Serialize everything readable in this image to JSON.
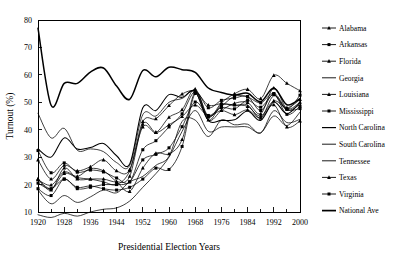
{
  "chart_data": {
    "type": "line",
    "title": "",
    "xlabel": "Presidential Election Years",
    "ylabel": "Turnout (%)",
    "xlim": [
      1920,
      2000
    ],
    "ylim": [
      10,
      80
    ],
    "grid": false,
    "legend_position": "right",
    "x": [
      1920,
      1924,
      1928,
      1932,
      1936,
      1940,
      1944,
      1948,
      1952,
      1956,
      1960,
      1964,
      1968,
      1972,
      1976,
      1980,
      1984,
      1988,
      1992,
      1996,
      2000
    ],
    "xtick_labels": [
      "1920",
      "1928",
      "1936",
      "1944",
      "1952",
      "1960",
      "1968",
      "1976",
      "1984",
      "1992",
      "2000"
    ],
    "xtick_values": [
      1920,
      1928,
      1936,
      1944,
      1952,
      1960,
      1968,
      1976,
      1984,
      1992,
      2000
    ],
    "xminor_tick_values": [
      1924,
      1932,
      1940,
      1948,
      1956,
      1964,
      1972,
      1980,
      1988,
      1996
    ],
    "ytick_labels": [
      "10",
      "20",
      "30",
      "40",
      "50",
      "60",
      "70",
      "80"
    ],
    "ytick_values": [
      10,
      20,
      30,
      40,
      50,
      60,
      70,
      80
    ],
    "series": [
      {
        "name": "Alabama",
        "marker": "triangle",
        "weight": "normal",
        "values": [
          21.8,
          19.8,
          24.6,
          23.0,
          25.8,
          25.0,
          21.0,
          17.5,
          26.0,
          31.4,
          31.2,
          36.4,
          53.7,
          43.5,
          47.0,
          49.6,
          49.9,
          45.8,
          55.2,
          47.7,
          50.0
        ]
      },
      {
        "name": "Arkansas",
        "marker": "square",
        "weight": "normal",
        "values": [
          32.4,
          24.3,
          27.9,
          24.5,
          25.3,
          24.6,
          22.4,
          21.0,
          32.7,
          36.0,
          41.0,
          45.8,
          54.0,
          48.0,
          50.7,
          51.5,
          52.1,
          47.0,
          53.2,
          47.4,
          47.7
        ]
      },
      {
        "name": "Florida",
        "marker": "triangle",
        "weight": "normal",
        "values": [
          29.0,
          22.0,
          27.0,
          25.0,
          26.5,
          29.0,
          25.0,
          25.5,
          43.0,
          44.0,
          48.8,
          53.0,
          54.0,
          49.0,
          49.5,
          49.0,
          48.5,
          45.0,
          50.5,
          48.0,
          51.0
        ]
      },
      {
        "name": "Georgia",
        "marker": "none",
        "weight": "normal",
        "values": [
          18.0,
          13.0,
          16.0,
          13.5,
          15.5,
          18.0,
          17.0,
          21.0,
          23.0,
          27.0,
          30.3,
          43.0,
          43.5,
          37.5,
          43.5,
          41.8,
          42.0,
          38.8,
          46.9,
          42.6,
          43.8
        ]
      },
      {
        "name": "Louisiana",
        "marker": "triangle",
        "weight": "normal",
        "values": [
          22.0,
          18.5,
          24.0,
          22.5,
          22.0,
          21.0,
          20.0,
          25.0,
          41.0,
          39.0,
          44.5,
          47.3,
          54.8,
          44.6,
          49.8,
          53.1,
          54.7,
          51.3,
          59.8,
          56.9,
          54.2
        ]
      },
      {
        "name": "Mississippi",
        "marker": "square",
        "weight": "normal",
        "values": [
          20.5,
          18.5,
          22.0,
          19.0,
          19.5,
          18.5,
          18.0,
          19.0,
          22.0,
          26.0,
          25.5,
          33.9,
          53.2,
          45.0,
          48.5,
          52.2,
          51.9,
          49.8,
          53.1,
          45.6,
          48.6
        ]
      },
      {
        "name": "North Carolina",
        "marker": "none",
        "weight": "medium",
        "values": [
          33.0,
          30.0,
          37.0,
          33.0,
          33.5,
          35.0,
          30.5,
          27.5,
          48.0,
          47.0,
          52.8,
          51.8,
          54.0,
          43.4,
          43.4,
          43.6,
          46.8,
          43.4,
          50.1,
          45.8,
          50.0
        ]
      },
      {
        "name": "South Carolina",
        "marker": "none",
        "weight": "normal",
        "values": [
          9.0,
          8.0,
          9.5,
          8.5,
          10.0,
          11.0,
          11.5,
          14.0,
          19.0,
          24.0,
          30.0,
          39.4,
          47.0,
          39.4,
          41.0,
          41.0,
          41.0,
          38.9,
          45.0,
          41.5,
          46.4
        ]
      },
      {
        "name": "Tennessee",
        "marker": "none",
        "weight": "normal",
        "values": [
          46.0,
          37.0,
          40.5,
          32.5,
          33.0,
          32.0,
          28.0,
          27.0,
          45.5,
          45.0,
          50.0,
          51.4,
          53.8,
          43.5,
          49.0,
          48.8,
          49.0,
          44.3,
          52.4,
          47.1,
          49.2
        ]
      },
      {
        "name": "Texas",
        "marker": "triangle",
        "weight": "normal",
        "values": [
          22.0,
          18.0,
          26.0,
          22.0,
          22.0,
          22.0,
          21.0,
          23.0,
          42.0,
          39.0,
          41.8,
          44.8,
          49.0,
          45.0,
          47.0,
          45.5,
          47.2,
          44.2,
          49.1,
          41.0,
          43.2
        ]
      },
      {
        "name": "Virginia",
        "marker": "square",
        "weight": "normal",
        "values": [
          18.5,
          16.0,
          22.0,
          18.5,
          19.0,
          20.0,
          20.0,
          21.0,
          29.0,
          31.0,
          33.4,
          41.1,
          50.1,
          45.2,
          48.1,
          47.6,
          50.7,
          48.2,
          52.8,
          47.5,
          52.6
        ]
      },
      {
        "name": "National Ave",
        "marker": "none",
        "weight": "thick",
        "values": [
          77.0,
          48.9,
          56.9,
          56.9,
          61.0,
          62.5,
          55.9,
          51.1,
          61.6,
          59.3,
          62.8,
          61.9,
          60.9,
          55.2,
          53.6,
          52.6,
          53.3,
          50.2,
          55.2,
          49.1,
          51.3
        ]
      }
    ]
  }
}
